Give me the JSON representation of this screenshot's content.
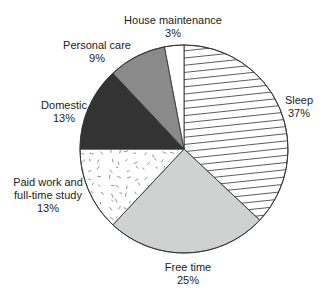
{
  "chart_data": {
    "type": "pie",
    "title": "",
    "start_angle_deg": 0,
    "direction": "clockwise",
    "slices": [
      {
        "label": "Sleep",
        "value": 37,
        "value_label": "37%",
        "fill": "#ffffff",
        "pattern": "hatch-lines"
      },
      {
        "label": "Free time",
        "value": 25,
        "value_label": "25%",
        "fill": "#d0d2d2",
        "pattern": "none"
      },
      {
        "label": "Paid work and full-time study",
        "label_lines": [
          "Paid work and",
          "full-time study"
        ],
        "value": 13,
        "value_label": "13%",
        "fill": "#ffffff",
        "pattern": "random-dashes"
      },
      {
        "label": "Domestic",
        "value": 13,
        "value_label": "13%",
        "fill": "#333333",
        "pattern": "none"
      },
      {
        "label": "Personal care",
        "value": 9,
        "value_label": "9%",
        "fill": "#8a8a8a",
        "pattern": "none"
      },
      {
        "label": "House maintenance",
        "value": 3,
        "value_label": "3%",
        "fill": "#ffffff",
        "pattern": "none"
      }
    ]
  },
  "labels": {
    "sleep": {
      "name": "Sleep",
      "pct": "37%"
    },
    "free_time": {
      "name": "Free time",
      "pct": "25%"
    },
    "paid_work": {
      "line1": "Paid work and",
      "line2": "full-time study",
      "pct": "13%"
    },
    "domestic": {
      "name": "Domestic",
      "pct": "13%"
    },
    "personal_care": {
      "name": "Personal care",
      "pct": "9%"
    },
    "house_maintenance": {
      "name": "House maintenance",
      "pct": "3%"
    }
  }
}
